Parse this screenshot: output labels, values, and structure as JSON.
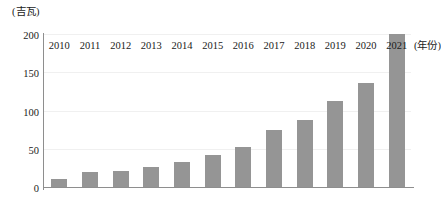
{
  "chart_data": {
    "type": "bar",
    "title": "",
    "subtitle": "",
    "xlabel": "(年份)",
    "ylabel": "(吉瓦)",
    "categories": [
      "2010",
      "2011",
      "2012",
      "2013",
      "2014",
      "2015",
      "2016",
      "2017",
      "2018",
      "2019",
      "2020",
      "2021"
    ],
    "values": [
      10,
      20,
      21,
      26,
      33,
      42,
      52,
      74,
      88,
      112,
      136,
      200
    ],
    "series": [
      {
        "name": "",
        "values": [
          10,
          20,
          21,
          26,
          33,
          42,
          52,
          74,
          88,
          112,
          136,
          200
        ]
      }
    ],
    "ylim": [
      0,
      200
    ],
    "y_ticks": [
      0,
      50,
      100,
      150,
      200
    ],
    "y_tick_labels": [
      "0",
      "50",
      "100",
      "150",
      "200"
    ],
    "x_tick_labels": [
      "2010",
      "2011",
      "2012",
      "2013",
      "2014",
      "2015",
      "2016",
      "2017",
      "2018",
      "2019",
      "2020",
      "2021"
    ],
    "grid": true,
    "legend": false,
    "legend_position": "none",
    "bar_color": "#959595",
    "axis_color": "#8e8e8e",
    "grid_color": "#f0f0f0",
    "background_color": "#ffffff"
  }
}
